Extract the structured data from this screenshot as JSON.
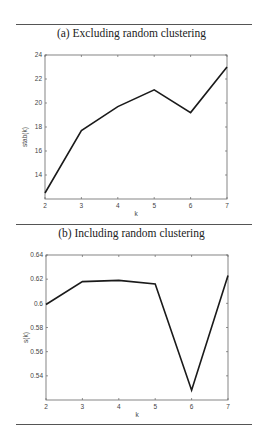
{
  "figure": {
    "panels": [
      {
        "caption": "(a) Excluding random clustering"
      },
      {
        "caption": "(b) Including random clustering"
      }
    ]
  },
  "chart_data": [
    {
      "type": "line",
      "title": "(a) Excluding random clustering",
      "xlabel": "k",
      "ylabel": "stab(k)",
      "x": [
        2,
        3,
        4,
        5,
        6,
        7
      ],
      "series": [
        {
          "name": "stab(k)",
          "values": [
            12.5,
            17.7,
            19.7,
            21.1,
            19.2,
            23.0
          ]
        }
      ],
      "xlim": [
        2,
        7
      ],
      "ylim": [
        12,
        24
      ],
      "xticks": [
        2,
        3,
        4,
        5,
        6,
        7
      ],
      "yticks": [
        14,
        16,
        18,
        20,
        22,
        24
      ],
      "grid": false,
      "legend": null,
      "color": "#1a1a1a"
    },
    {
      "type": "line",
      "title": "(b) Including random clustering",
      "xlabel": "k",
      "ylabel": "s(k)",
      "x": [
        2,
        3,
        4,
        5,
        6,
        7
      ],
      "series": [
        {
          "name": "s(k)",
          "values": [
            0.599,
            0.618,
            0.619,
            0.616,
            0.528,
            0.623
          ]
        }
      ],
      "xlim": [
        2,
        7
      ],
      "ylim": [
        0.52,
        0.64
      ],
      "xticks": [
        2,
        3,
        4,
        5,
        6,
        7
      ],
      "yticks": [
        "0.54",
        "0.56",
        "0.58",
        "0.6",
        "0.62",
        "0.64"
      ],
      "grid": false,
      "legend": null,
      "color": "#1a1a1a"
    }
  ]
}
